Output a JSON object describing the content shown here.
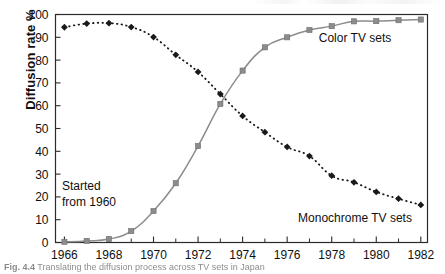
{
  "figure": {
    "caption_label": "Fig. 4.4",
    "caption_text": "Translating the diffusion process across TV sets in Japan"
  },
  "axes": {
    "y_title": "Diffusion rate %",
    "y_ticks": [
      "0",
      "10",
      "20",
      "30",
      "40",
      "50",
      "60",
      "70",
      "80",
      "90",
      "100"
    ],
    "x_ticks": [
      "1966",
      "1968",
      "1970",
      "1972",
      "1974",
      "1976",
      "1978",
      "1980",
      "1982"
    ]
  },
  "annotations": {
    "started_line1": "Started",
    "started_line2": "from 1960",
    "color_label": "Color TV sets",
    "mono_label": "Monochrome TV sets"
  },
  "colors": {
    "color_series": "#8c8c8c",
    "mono_series": "#1a1a1a",
    "axis": "#2b2b2b",
    "text": "#101010"
  },
  "chart_data": {
    "type": "line",
    "title": "",
    "xlabel": "",
    "ylabel": "Diffusion rate %",
    "xlim": [
      1965.6,
      1982.3
    ],
    "ylim": [
      0,
      100
    ],
    "grid": false,
    "legend": "inline-annotations",
    "x": [
      1966,
      1967,
      1968,
      1969,
      1970,
      1971,
      1972,
      1973,
      1974,
      1975,
      1976,
      1977,
      1978,
      1979,
      1980,
      1981,
      1982
    ],
    "series": [
      {
        "name": "Color TV sets",
        "marker": "square",
        "line": "solid",
        "color": "#8c8c8c",
        "values": [
          0.3,
          0.7,
          1.5,
          5.0,
          13.8,
          26.0,
          42.3,
          60.8,
          75.4,
          85.6,
          90.0,
          93.2,
          94.9,
          97.0,
          97.1,
          97.5,
          97.8
        ]
      },
      {
        "name": "Monochrome TV sets",
        "marker": "diamond",
        "line": "dotted",
        "color": "#1a1a1a",
        "values": [
          94.4,
          96.0,
          96.2,
          94.5,
          90.1,
          82.3,
          74.8,
          65.1,
          55.5,
          48.4,
          41.9,
          37.9,
          29.3,
          26.4,
          22.2,
          19.2,
          16.5
        ]
      }
    ],
    "note": "Color TV series is labelled 'Started from 1960'; curves cross near 1972.5 at about 68%."
  }
}
